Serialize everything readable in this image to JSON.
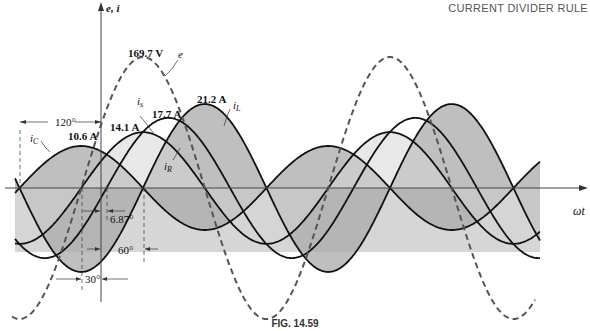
{
  "header": {
    "section_title": "CURRENT DIVIDER RULE"
  },
  "caption": "FIG. 14.59",
  "axes": {
    "y_label": "e, i",
    "x_label": "ωt"
  },
  "colors": {
    "curve": "#111111",
    "dashed": "#555555",
    "shade_dark": "#a9a9a9",
    "shade_light": "#d6d6d6",
    "axis": "#444444"
  },
  "labels": {
    "e_peak": "169.7 V",
    "e_name": "e",
    "is_peak": "17.7 A",
    "is_name": "i",
    "is_sub": "s",
    "iL_peak": "21.2 A",
    "iL_name": "i",
    "iL_sub": "L",
    "iR_peak": "14.1 A",
    "iR_name": "i",
    "iR_sub": "R",
    "iC_peak": "10.6 A",
    "iC_name": "i",
    "iC_sub": "C",
    "angle_120": "120°",
    "angle_6_87": "6.87°",
    "angle_60": "60°",
    "angle_30": "30°"
  },
  "chart_data": {
    "type": "line",
    "title": "FIG. 14.59",
    "xlabel": "ωt",
    "ylabel": "e, i",
    "period_deg": 360,
    "series": [
      {
        "name": "e",
        "amplitude": 169.7,
        "unit": "V",
        "phase_deg": 0,
        "style": "dashed"
      },
      {
        "name": "i_R",
        "amplitude": 14.1,
        "unit": "A",
        "phase_deg": 0,
        "style": "solid"
      },
      {
        "name": "i_C",
        "amplitude": 10.6,
        "unit": "A",
        "phase_deg": 90,
        "style": "solid"
      },
      {
        "name": "i_L",
        "amplitude": 21.2,
        "unit": "A",
        "phase_deg": -90,
        "style": "solid"
      },
      {
        "name": "i_s",
        "amplitude": 17.7,
        "unit": "A",
        "phase_deg": -36.87,
        "style": "solid"
      }
    ],
    "annotations": [
      "120°",
      "6.87°",
      "60°",
      "30°"
    ],
    "grid": false
  },
  "geometry": {
    "origin_x": 101,
    "axis_y": 188,
    "e_peak_x": 143,
    "px_per_deg": 0.686,
    "e_amp_px": 131,
    "px_per_amp": 3.96,
    "x_start": 15,
    "x_end": 540
  }
}
